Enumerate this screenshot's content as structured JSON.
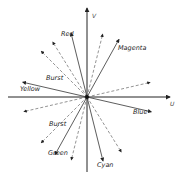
{
  "diagram": {
    "axes": {
      "vertical_label": "V",
      "horizontal_label": "U"
    },
    "solid_vectors": [
      {
        "label": "Red",
        "angle_deg": 104
      },
      {
        "label": "Magenta",
        "angle_deg": 61
      },
      {
        "label": "Yellow",
        "angle_deg": 167
      },
      {
        "label": "Blue",
        "angle_deg": -13
      },
      {
        "label": "Green",
        "angle_deg": 241
      },
      {
        "label": "Cyan",
        "angle_deg": 284
      }
    ],
    "dashed_vectors": [
      {
        "label": "",
        "angle_deg": 76
      },
      {
        "label": "",
        "angle_deg": 122
      },
      {
        "label": "Burst",
        "angle_deg": 135
      },
      {
        "label": "",
        "angle_deg": 13
      },
      {
        "label": "",
        "angle_deg": 193
      },
      {
        "label": "Burst",
        "angle_deg": 225
      },
      {
        "label": "",
        "angle_deg": 256
      },
      {
        "label": "",
        "angle_deg": 302
      }
    ],
    "labels": {
      "red": "Red",
      "magenta": "Magenta",
      "yellow": "Yellow",
      "blue": "Blue",
      "green": "Green",
      "cyan": "Cyan",
      "burst_upper": "Burst",
      "burst_lower": "Burst",
      "v_axis": "V",
      "u_axis": "U"
    }
  }
}
